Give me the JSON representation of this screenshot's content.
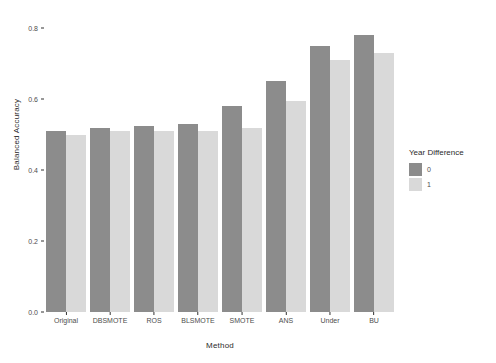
{
  "chart_data": {
    "type": "bar",
    "title": "",
    "xlabel": "Method",
    "ylabel": "Balanced Accuracy",
    "categories": [
      "Original",
      "DBSMOTE",
      "ROS",
      "BLSMOTE",
      "SMOTE",
      "ANS",
      "Under",
      "BU"
    ],
    "series": [
      {
        "name": "0",
        "color": "#8c8c8c",
        "values": [
          0.51,
          0.52,
          0.525,
          0.53,
          0.58,
          0.65,
          0.75,
          0.78
        ]
      },
      {
        "name": "1",
        "color": "#d9d9d9",
        "values": [
          0.5,
          0.51,
          0.51,
          0.51,
          0.52,
          0.595,
          0.71,
          0.73
        ]
      }
    ],
    "ylim": [
      0.0,
      0.84
    ],
    "yticks": [
      0.0,
      0.2,
      0.4,
      0.6,
      0.8
    ],
    "ytick_labels": [
      "0.0",
      "0.2",
      "0.4",
      "0.6",
      "0.8"
    ],
    "grid": false,
    "legend": {
      "title": "Year Difference",
      "position": "right",
      "entries": [
        {
          "label": "0",
          "color": "#8c8c8c"
        },
        {
          "label": "1",
          "color": "#d9d9d9"
        }
      ]
    },
    "background": "#ffffff",
    "axis_color": "#333333",
    "text_color": "#4d4d4d"
  }
}
